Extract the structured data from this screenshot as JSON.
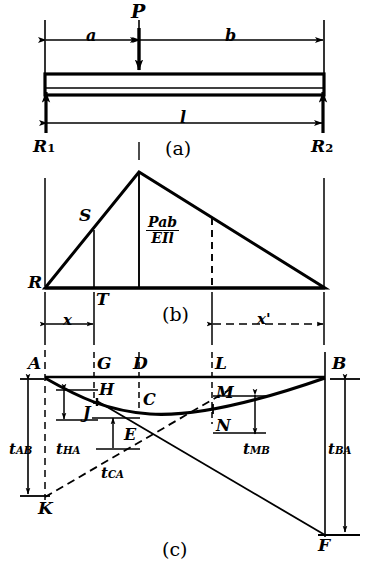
{
  "figure": {
    "panels": [
      {
        "id": "a",
        "caption": "(a)",
        "description": "free-body / loading diagram"
      },
      {
        "id": "b",
        "caption": "(b)",
        "description": "M/EI diagram (triangle)"
      },
      {
        "id": "c",
        "caption": "(c)",
        "description": "elastic curve with tangential deviations"
      }
    ]
  },
  "panel_a": {
    "load_label": "P",
    "dim_a": "a",
    "dim_b": "b",
    "dim_l": "l",
    "reaction_left": "R",
    "reaction_left_sub": "1",
    "reaction_right": "R",
    "reaction_right_sub": "2",
    "caption": "(a)"
  },
  "panel_b": {
    "vertex_left": "R",
    "point_S": "S",
    "point_T": "T",
    "ordinate_numerator": "Pab",
    "ordinate_denominator": "EIl",
    "caption": "(b)"
  },
  "panel_bc_dims": {
    "x": "x",
    "x_prime": "x'"
  },
  "panel_c": {
    "points": {
      "A": "A",
      "B": "B",
      "G": "G",
      "D": "D",
      "L": "L",
      "H": "H",
      "C": "C",
      "M": "M",
      "J": "J",
      "N": "N",
      "E": "E",
      "K": "K",
      "F": "F"
    },
    "deviations": {
      "t_AB": {
        "base": "t",
        "sub": "AB"
      },
      "t_HA": {
        "base": "t",
        "sub": "HA"
      },
      "t_CA": {
        "base": "t",
        "sub": "CA"
      },
      "t_MB": {
        "base": "t",
        "sub": "MB"
      },
      "t_BA": {
        "base": "t",
        "sub": "BA"
      }
    },
    "caption": "(c)"
  },
  "style": {
    "ink": "#000000",
    "paper": "#ffffff"
  }
}
